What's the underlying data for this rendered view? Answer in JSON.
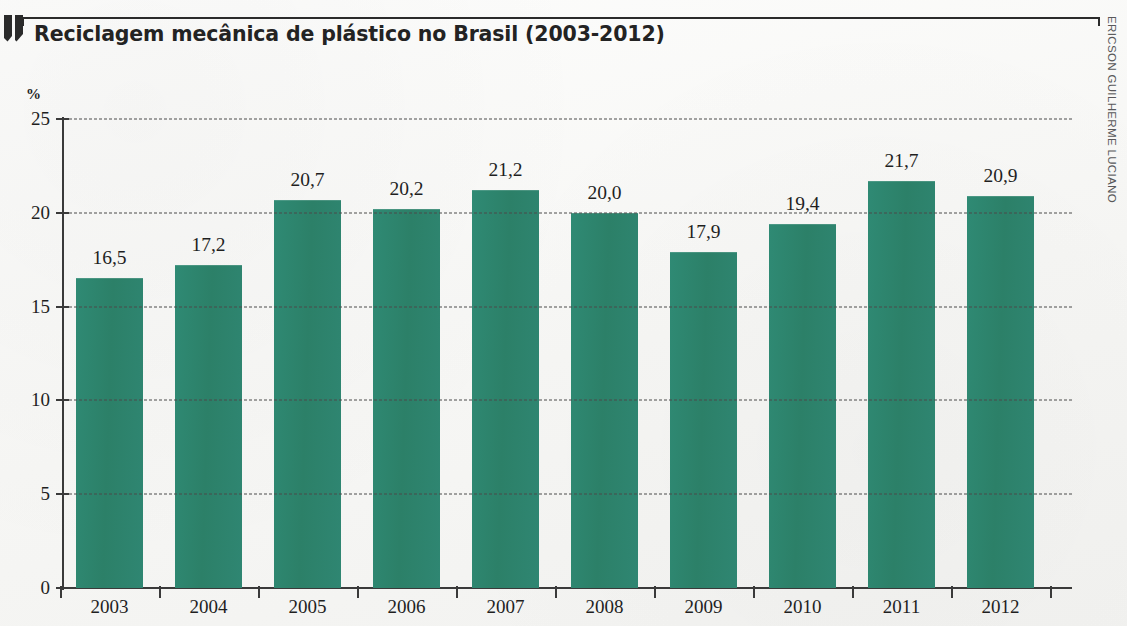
{
  "header": {
    "title": "Reciclagem mecânica de plástico no Brasil (2003-2012)",
    "logo_icon": "angular-bracket-logo-icon",
    "credit": "ERICSON GUILHERME LUCIANO"
  },
  "colors": {
    "bar": "#2c8068",
    "axis": "#3a3a3a",
    "gridline": "#4a4a4a",
    "text": "#1f1f1f",
    "page_background": "#f6f6f4",
    "credit_text": "#58585a"
  },
  "chart_data": {
    "type": "bar",
    "title": "Reciclagem mecânica de plástico no Brasil (2003-2012)",
    "xlabel": "",
    "ylabel": "%",
    "unit": "%",
    "ylim": [
      0,
      25
    ],
    "yticks": [
      0,
      5,
      10,
      15,
      20,
      25
    ],
    "ytick_labels": [
      "0",
      "5",
      "10",
      "15",
      "20",
      "25"
    ],
    "grid": true,
    "grid_style": "dashed",
    "legend": false,
    "categories": [
      "2003",
      "2004",
      "2005",
      "2006",
      "2007",
      "2008",
      "2009",
      "2010",
      "2011",
      "2012"
    ],
    "values": [
      16.5,
      17.2,
      20.7,
      20.2,
      21.2,
      20.0,
      17.9,
      19.4,
      21.7,
      20.9
    ],
    "value_labels": [
      "16,5",
      "17,2",
      "20,7",
      "20,2",
      "21,2",
      "20,0",
      "17,9",
      "19,4",
      "21,7",
      "20,9"
    ]
  }
}
